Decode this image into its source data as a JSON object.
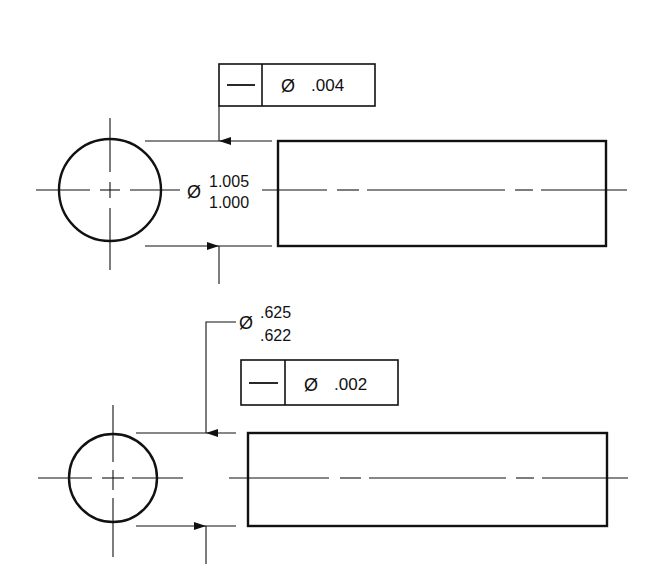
{
  "drawing": {
    "title": "Straightness of axis tolerance examples",
    "views": [
      {
        "id": "top",
        "diameter_symbol": "Ø",
        "size_limits": {
          "upper": "1.005",
          "lower": "1.000"
        },
        "feature_control_frame": {
          "characteristic_symbol": "—",
          "tolerance_modifier": "Ø",
          "tolerance_value": ".004"
        }
      },
      {
        "id": "bottom",
        "diameter_symbol": "Ø",
        "size_limits": {
          "upper": ".625",
          "lower": ".622"
        },
        "feature_control_frame": {
          "characteristic_symbol": "—",
          "tolerance_modifier": "Ø",
          "tolerance_value": ".002"
        }
      }
    ]
  },
  "colors": {
    "line": "#111111",
    "background": "#ffffff"
  }
}
